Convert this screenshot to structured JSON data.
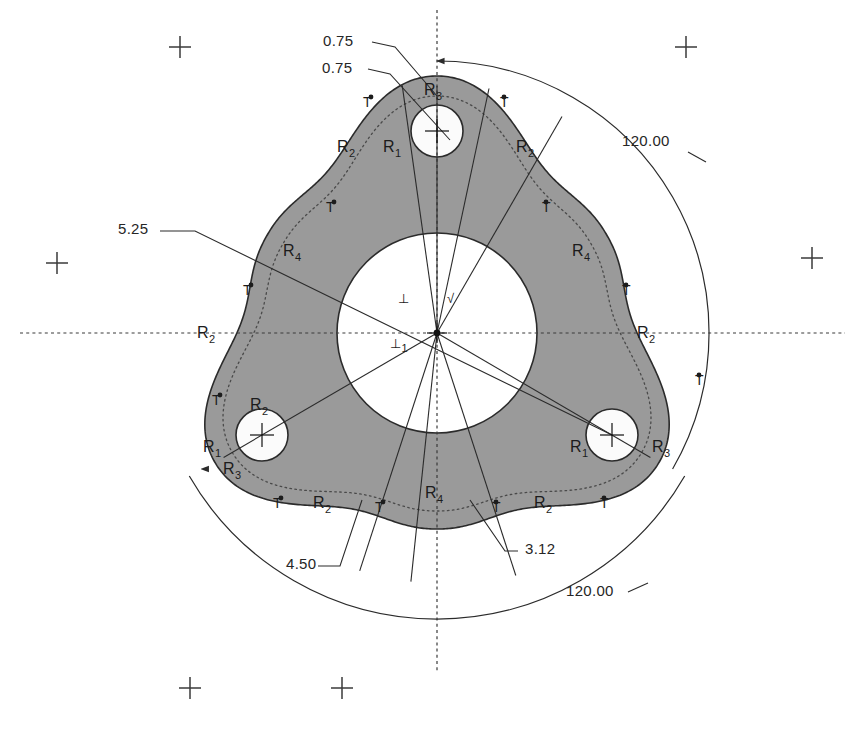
{
  "drawing": {
    "title": "Rotor / Triangular Cam Plate Geometry",
    "background_color": "#ffffff",
    "line_color": "#2b2b2b",
    "fill_color": "#9a9a9a",
    "hole_fill_color": "#fbfbfb",
    "center_fill_color": "#ffffff",
    "canvas": {
      "width": 861,
      "height": 735
    },
    "geometry": {
      "center": {
        "x": 437,
        "y": 333
      },
      "inner_bore_radius": 100,
      "bolt_circle_radius": 203,
      "hole_radius": 26,
      "outer_reference_radius": 272,
      "dotted_offset_radius": 238,
      "holes": [
        {
          "name": "hole-top",
          "x": 437,
          "y": 131
        },
        {
          "name": "hole-lower-left",
          "x": 262,
          "y": 435
        },
        {
          "name": "hole-lower-right",
          "x": 612,
          "y": 435
        }
      ]
    },
    "dimensions": [
      {
        "name": "dim-075-upper",
        "value": "0.75",
        "x": 323,
        "y": 46
      },
      {
        "name": "dim-075-lower",
        "value": "0.75",
        "x": 322,
        "y": 73
      },
      {
        "name": "dim-120-upper-right",
        "value": "120.00",
        "x": 622,
        "y": 146
      },
      {
        "name": "dim-525-left",
        "value": "5.25",
        "x": 118,
        "y": 234
      },
      {
        "name": "dim-450-bottom",
        "value": "4.50",
        "x": 286,
        "y": 569
      },
      {
        "name": "dim-312-bottom",
        "value": "3.12",
        "x": 525,
        "y": 554
      },
      {
        "name": "dim-120-bottom",
        "value": "120.00",
        "x": 566,
        "y": 596
      }
    ],
    "radius_labels": [
      {
        "name": "radius-label-r3-top",
        "base": "R",
        "sub": "3",
        "x": 424,
        "y": 95
      },
      {
        "name": "radius-label-r1-top",
        "base": "R",
        "sub": "1",
        "x": 383,
        "y": 152
      },
      {
        "name": "radius-label-r2-upper-left",
        "base": "R",
        "sub": "2",
        "x": 337,
        "y": 152
      },
      {
        "name": "radius-label-r2-upper-right",
        "base": "R",
        "sub": "2",
        "x": 516,
        "y": 152
      },
      {
        "name": "radius-label-r4-left",
        "base": "R",
        "sub": "4",
        "x": 283,
        "y": 256
      },
      {
        "name": "radius-label-r4-right",
        "base": "R",
        "sub": "4",
        "x": 572,
        "y": 256
      },
      {
        "name": "radius-label-r2-left-mid",
        "base": "R",
        "sub": "2",
        "x": 197,
        "y": 338
      },
      {
        "name": "radius-label-r2-right-mid",
        "base": "R",
        "sub": "2",
        "x": 637,
        "y": 338
      },
      {
        "name": "radius-label-r2-hole-left",
        "base": "R",
        "sub": "2",
        "x": 250,
        "y": 410
      },
      {
        "name": "radius-label-r1-lower-left",
        "base": "R",
        "sub": "1",
        "x": 203,
        "y": 452
      },
      {
        "name": "radius-label-r3-lower-left",
        "base": "R",
        "sub": "3",
        "x": 223,
        "y": 474
      },
      {
        "name": "radius-label-r1-lower-right",
        "base": "R",
        "sub": "1",
        "x": 570,
        "y": 452
      },
      {
        "name": "radius-label-r3-lower-right",
        "base": "R",
        "sub": "3",
        "x": 652,
        "y": 452
      },
      {
        "name": "radius-label-r4-bottom",
        "base": "R",
        "sub": "4",
        "x": 425,
        "y": 498
      },
      {
        "name": "radius-label-r2-bottom-left",
        "base": "R",
        "sub": "2",
        "x": 313,
        "y": 508
      },
      {
        "name": "radius-label-r2-bottom-right",
        "base": "R",
        "sub": "2",
        "x": 534,
        "y": 508
      }
    ],
    "tangent_labels": [
      {
        "name": "tangent-mark",
        "value": "T",
        "x": 363,
        "y": 107
      },
      {
        "name": "tangent-mark",
        "value": "T",
        "x": 500,
        "y": 107
      },
      {
        "name": "tangent-mark",
        "value": "T",
        "x": 326,
        "y": 212
      },
      {
        "name": "tangent-mark",
        "value": "T",
        "x": 542,
        "y": 212
      },
      {
        "name": "tangent-mark",
        "value": "T",
        "x": 243,
        "y": 295
      },
      {
        "name": "tangent-mark",
        "value": "T",
        "x": 622,
        "y": 295
      },
      {
        "name": "tangent-mark",
        "value": "T",
        "x": 212,
        "y": 405
      },
      {
        "name": "tangent-mark",
        "value": "T",
        "x": 695,
        "y": 385
      },
      {
        "name": "tangent-mark",
        "value": "T",
        "x": 273,
        "y": 508
      },
      {
        "name": "tangent-mark",
        "value": "T",
        "x": 375,
        "y": 512
      },
      {
        "name": "tangent-mark",
        "value": "T",
        "x": 492,
        "y": 512
      },
      {
        "name": "tangent-mark",
        "value": "T",
        "x": 600,
        "y": 508
      }
    ],
    "gd_symbols": [
      {
        "name": "perpendicular-symbol-upper",
        "glyph": "⊥",
        "sub": "",
        "x": 398,
        "y": 303
      },
      {
        "name": "perpendicular-symbol-lower",
        "glyph": "⊥",
        "sub": "1",
        "x": 390,
        "y": 348
      },
      {
        "name": "check-symbol-center",
        "glyph": "√",
        "sub": "",
        "x": 447,
        "y": 303
      }
    ],
    "registration_marks": [
      {
        "name": "registration-cross-top-left",
        "x": 180,
        "y": 47
      },
      {
        "name": "registration-cross-top-right",
        "x": 686,
        "y": 47
      },
      {
        "name": "registration-cross-mid-left",
        "x": 57,
        "y": 263
      },
      {
        "name": "registration-cross-mid-right",
        "x": 812,
        "y": 258
      },
      {
        "name": "registration-cross-bottom-left",
        "x": 190,
        "y": 688
      },
      {
        "name": "registration-cross-bottom-right",
        "x": 342,
        "y": 688
      }
    ],
    "centerlines": {
      "horizontal": {
        "x1": 20,
        "y1": 333,
        "x2": 845,
        "y2": 333
      },
      "vertical": {
        "x1": 437,
        "y1": 10,
        "x2": 437,
        "y2": 672
      }
    }
  }
}
